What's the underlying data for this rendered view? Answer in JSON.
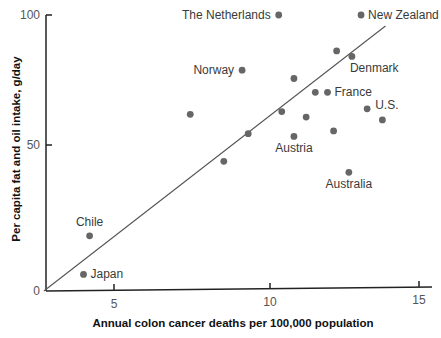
{
  "chart_data": {
    "type": "scatter",
    "title": "",
    "xlabel": "Annual colon cancer deaths per 100,000 population",
    "ylabel": "Per capita fat and oil intake, g/day",
    "xlim": [
      2.7,
      15.5
    ],
    "ylim": [
      0,
      100
    ],
    "x_ticks": [
      5,
      10,
      15
    ],
    "y_ticks": [
      0,
      50,
      100
    ],
    "origin_label": "0",
    "grid": false,
    "legend": null,
    "trend_line": {
      "x": [
        2.7,
        13.9
      ],
      "y": [
        0,
        96
      ]
    },
    "points": [
      {
        "x": 10.4,
        "y": 100,
        "label": "The Netherlands",
        "label_pos": "left"
      },
      {
        "x": 13.1,
        "y": 100,
        "label": "New Zealand",
        "label_pos": "right"
      },
      {
        "x": 12.3,
        "y": 87,
        "label": ""
      },
      {
        "x": 12.8,
        "y": 85,
        "label": "Denmark",
        "label_pos": "below-right"
      },
      {
        "x": 9.2,
        "y": 80,
        "label": "Norway",
        "label_pos": "left"
      },
      {
        "x": 10.9,
        "y": 77,
        "label": ""
      },
      {
        "x": 11.6,
        "y": 72,
        "label": ""
      },
      {
        "x": 12.0,
        "y": 72,
        "label": "France",
        "label_pos": "right"
      },
      {
        "x": 7.5,
        "y": 64,
        "label": ""
      },
      {
        "x": 10.5,
        "y": 65,
        "label": ""
      },
      {
        "x": 13.3,
        "y": 66,
        "label": "U.S.",
        "label_pos": "right-up"
      },
      {
        "x": 11.3,
        "y": 63,
        "label": ""
      },
      {
        "x": 13.8,
        "y": 62,
        "label": ""
      },
      {
        "x": 9.4,
        "y": 57,
        "label": ""
      },
      {
        "x": 12.2,
        "y": 58,
        "label": ""
      },
      {
        "x": 10.9,
        "y": 56,
        "label": "Austria",
        "label_pos": "below"
      },
      {
        "x": 8.6,
        "y": 47,
        "label": ""
      },
      {
        "x": 12.7,
        "y": 43,
        "label": "Australia",
        "label_pos": "below"
      },
      {
        "x": 4.2,
        "y": 20,
        "label": "Chile",
        "label_pos": "above"
      },
      {
        "x": 4.0,
        "y": 6,
        "label": "Japan",
        "label_pos": "right"
      }
    ]
  },
  "colors": {
    "axis": "#222222",
    "point": "#666666",
    "trend": "#555555"
  }
}
